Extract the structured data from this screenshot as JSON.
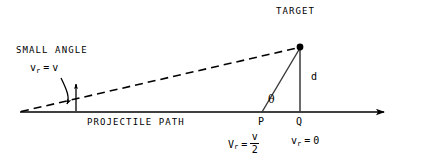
{
  "figure": {
    "title_label": "TARGET",
    "small_angle_label": "SMALL ANGLE",
    "projectile_path_label": "PROJECTILE PATH",
    "distance_label": "d",
    "angle_label": "θ",
    "point_p_label": "P",
    "point_q_label": "Q",
    "stroke_color": "#000000",
    "background_color": "#ffffff"
  },
  "expressions": {
    "radial_velocity_full": {
      "var": "v",
      "subscript": "r",
      "equals": "=",
      "value": "v"
    },
    "radial_velocity_half": {
      "var": "V",
      "subscript": "r",
      "equals": "=",
      "numerator": "v",
      "denominator": "2"
    },
    "radial_velocity_zero": {
      "var": "v",
      "subscript": "r",
      "equals": "=",
      "value": "0"
    }
  },
  "geometry": {
    "axis": {
      "x1": 20,
      "y1": 112,
      "x2": 390,
      "y2": 112
    },
    "sight_line_dashed": {
      "x1": 20,
      "y1": 112,
      "x2": 300,
      "y2": 47
    },
    "target_point": {
      "x": 300,
      "y": 47
    },
    "vertical_d": {
      "x1": 300,
      "y1": 47,
      "x2": 300,
      "y2": 112
    },
    "slant_pt": {
      "x1": 262,
      "y1": 112,
      "x2": 300,
      "y2": 47
    },
    "point_p": {
      "x": 262,
      "y": 112
    },
    "point_q": {
      "x": 300,
      "y": 112
    }
  }
}
